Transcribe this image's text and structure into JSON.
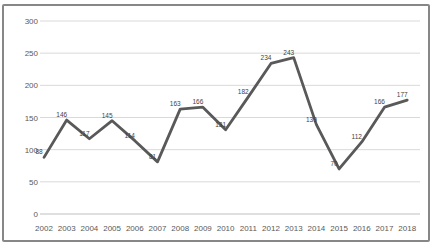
{
  "chart_data": {
    "type": "line",
    "title": "",
    "xlabel": "",
    "ylabel": "",
    "categories": [
      "2002",
      "2003",
      "2004",
      "2005",
      "2006",
      "2007",
      "2008",
      "2009",
      "2010",
      "2011",
      "2012",
      "2013",
      "2014",
      "2015",
      "2016",
      "2017",
      "2018"
    ],
    "series": [
      {
        "name": "",
        "values": [
          88,
          146,
          117,
          145,
          114,
          81,
          163,
          166,
          131,
          182,
          234,
          243,
          139,
          70,
          112,
          166,
          177
        ]
      }
    ],
    "ylim": [
      0,
      300
    ],
    "yticks": [
      0,
      50,
      100,
      150,
      200,
      250,
      300
    ],
    "grid": true,
    "legend_position": "none",
    "show_data_labels": true,
    "line_color": "#595959",
    "label_color": "#3f3f3f",
    "tick_color": "#595959",
    "grid_color": "#d9d9d9",
    "axis_color": "#c0c0c0"
  },
  "frame": {
    "border_color": "#878787",
    "background": "#ffffff"
  }
}
